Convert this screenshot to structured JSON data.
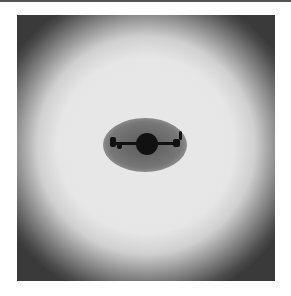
{
  "image": {
    "description": "Grayscale image of a bright annular glow around a dark oval cavity containing a dark central disk with ragged horizontal arms",
    "colors": {
      "edge": "#3a3a3a",
      "ring": "#e6e6e6",
      "cavity": "#777777",
      "core": "#111111"
    }
  }
}
